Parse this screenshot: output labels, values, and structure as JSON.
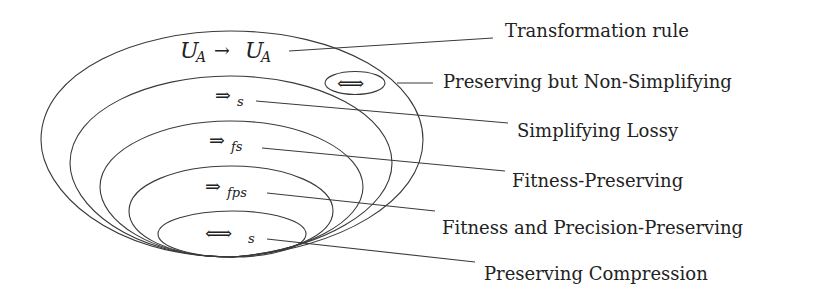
{
  "diagram": {
    "sets": [
      {
        "id": "transformation-rule",
        "symbol": {
          "main": "U",
          "main_sub": "A",
          "arrow": "→",
          "target": "U",
          "target_sub": "A"
        },
        "label": "Transformation rule"
      },
      {
        "id": "preserving-non-simplifying",
        "symbol": {
          "arrow": "⟺"
        },
        "label": "Preserving but Non-Simplifying"
      },
      {
        "id": "simplifying-lossy",
        "symbol": {
          "arrow": "⇒",
          "sub": "s"
        },
        "label": "Simplifying Lossy"
      },
      {
        "id": "fitness-preserving",
        "symbol": {
          "arrow": "⇒",
          "sub": "fs"
        },
        "label": "Fitness-Preserving"
      },
      {
        "id": "fitness-precision-preserving",
        "symbol": {
          "arrow": "⇒",
          "sub": "fps"
        },
        "label": "Fitness and Precision-Preserving"
      },
      {
        "id": "preserving-compression",
        "symbol": {
          "arrow": "⟺",
          "sub": "s"
        },
        "label": "Preserving Compression"
      }
    ],
    "colors": {
      "stroke": "#3a3a3a",
      "text": "#222222",
      "background": "#ffffff"
    }
  }
}
